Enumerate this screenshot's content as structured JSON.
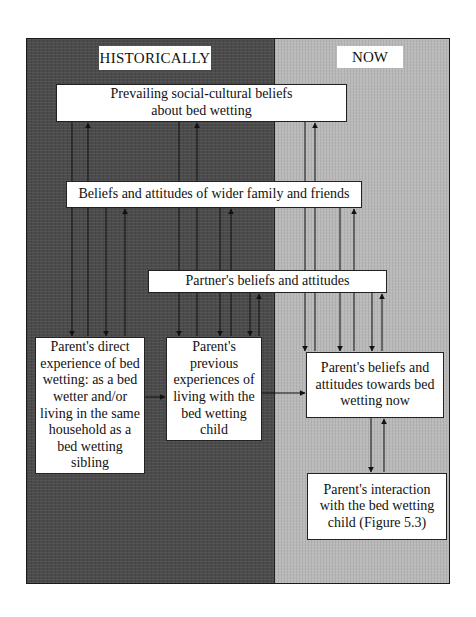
{
  "diagram": {
    "panels": {
      "historically": {
        "label": "HISTORICALLY",
        "color": "#4b4b4b"
      },
      "now": {
        "label": "NOW",
        "color": "#b9b9b9"
      }
    },
    "nodes": {
      "social_cultural": "Prevailing social-cultural beliefs about bed wetting",
      "wider_family": "Beliefs and attitudes of wider family and friends",
      "partner": "Partner's beliefs and attitudes",
      "direct_experience": "Parent's direct experience of bed wetting: as a bed wetter and/or living in the same household as a bed wetting sibling",
      "previous_experiences": "Parent's previous experiences of living with the bed wetting child",
      "beliefs_now": "Parent's beliefs and attitudes towards bed wetting now",
      "interaction": "Parent's interaction with the bed wetting child (Figure 5.3)"
    },
    "edges": [
      {
        "from": "social_cultural",
        "to": "direct_experience",
        "direction": "bidirectional"
      },
      {
        "from": "social_cultural",
        "to": "previous_experiences",
        "direction": "bidirectional"
      },
      {
        "from": "social_cultural",
        "to": "beliefs_now",
        "direction": "bidirectional"
      },
      {
        "from": "wider_family",
        "to": "direct_experience",
        "direction": "bidirectional"
      },
      {
        "from": "wider_family",
        "to": "previous_experiences",
        "direction": "bidirectional"
      },
      {
        "from": "wider_family",
        "to": "beliefs_now",
        "direction": "bidirectional"
      },
      {
        "from": "partner",
        "to": "previous_experiences",
        "direction": "bidirectional"
      },
      {
        "from": "partner",
        "to": "beliefs_now",
        "direction": "bidirectional"
      },
      {
        "from": "direct_experience",
        "to": "previous_experiences",
        "direction": "forward"
      },
      {
        "from": "previous_experiences",
        "to": "beliefs_now",
        "direction": "forward"
      },
      {
        "from": "beliefs_now",
        "to": "interaction",
        "direction": "bidirectional"
      }
    ]
  }
}
